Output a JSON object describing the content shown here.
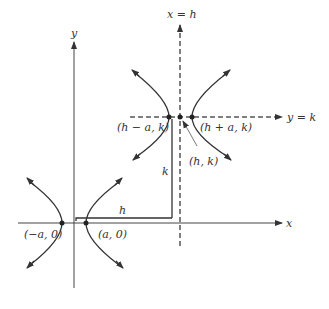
{
  "diagram": {
    "type": "hyperbola-translation",
    "axes": {
      "x_label": "x",
      "y_label": "y"
    },
    "asymptote_lines": {
      "vertical_label": "x = h",
      "horizontal_label": "y = k"
    },
    "original_hyperbola": {
      "left_vertex_label": "(−a, 0)",
      "right_vertex_label": "(a, 0)"
    },
    "translated_hyperbola": {
      "left_vertex_label": "(h − a, k)",
      "right_vertex_label": "(h + a, k)",
      "center_label": "(h, k)"
    },
    "shift_labels": {
      "horizontal": "h",
      "vertical": "k"
    },
    "colors": {
      "stroke": "#333333",
      "dashed": "#555555",
      "background": "#ffffff"
    }
  }
}
